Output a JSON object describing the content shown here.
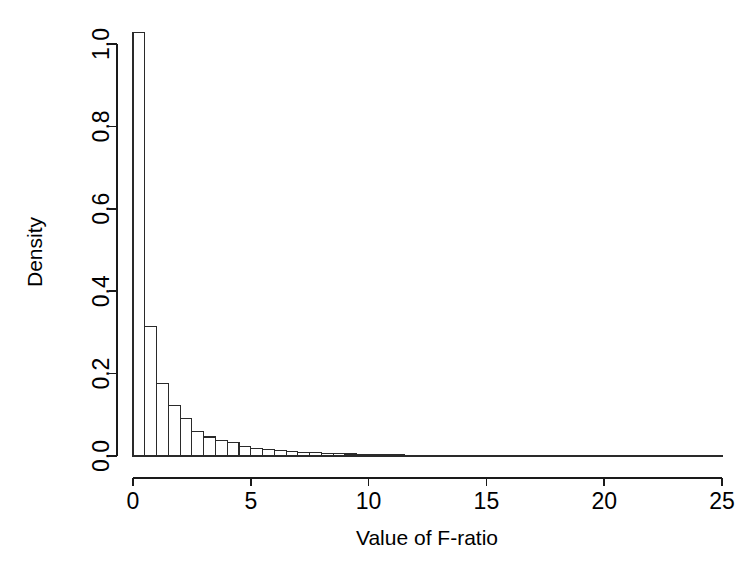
{
  "chart_data": {
    "type": "bar",
    "title": "",
    "subtitle": "",
    "xlabel": "Value of F-ratio",
    "ylabel": "Density",
    "xlim": [
      0,
      25
    ],
    "ylim": [
      0.0,
      1.0
    ],
    "grid": false,
    "legend": null,
    "bin_width": 0.5,
    "x_ticks": [
      0,
      5,
      10,
      15,
      20,
      25
    ],
    "x_tick_labels": [
      "0",
      "5",
      "10",
      "15",
      "20",
      "25"
    ],
    "y_ticks": [
      0.0,
      0.2,
      0.4,
      0.6,
      0.8,
      1.0
    ],
    "y_tick_labels": [
      "0.0",
      "0.2",
      "0.4",
      "0.6",
      "0.8",
      "1.0"
    ],
    "bin_starts": [
      0.0,
      0.5,
      1.0,
      1.5,
      2.0,
      2.5,
      3.0,
      3.5,
      4.0,
      4.5,
      5.0,
      5.5,
      6.0,
      6.5,
      7.0,
      7.5,
      8.0,
      8.5,
      9.0,
      9.5,
      10.0,
      10.5,
      11.0,
      11.5,
      12.0,
      12.5,
      13.0,
      13.5,
      14.0,
      14.5,
      15.0,
      15.5,
      16.0,
      16.5,
      17.0,
      17.5,
      18.0,
      18.5,
      19.0,
      19.5,
      20.0,
      20.5,
      21.0,
      21.5,
      22.0,
      22.5,
      23.0,
      23.5,
      24.0,
      24.5
    ],
    "categories": [
      "0.0-0.5",
      "0.5-1.0",
      "1.0-1.5",
      "1.5-2.0",
      "2.0-2.5",
      "2.5-3.0",
      "3.0-3.5",
      "3.5-4.0",
      "4.0-4.5",
      "4.5-5.0",
      "5.0-5.5",
      "5.5-6.0",
      "6.0-6.5",
      "6.5-7.0",
      "7.0-7.5",
      "7.5-8.0",
      "8.0-8.5",
      "8.5-9.0",
      "9.0-9.5",
      "9.5-10.0",
      "10.0-10.5",
      "10.5-11.0",
      "11.0-11.5",
      "11.5-12.0",
      "12.0-12.5",
      "12.5-13.0",
      "13.0-13.5",
      "13.5-14.0",
      "14.0-14.5",
      "14.5-15.0",
      "15.0-15.5",
      "15.5-16.0",
      "16.0-16.5",
      "16.5-17.0",
      "17.0-17.5",
      "17.5-18.0",
      "18.0-18.5",
      "18.5-19.0",
      "19.0-19.5",
      "19.5-20.0",
      "20.0-20.5",
      "20.5-21.0",
      "21.0-21.5",
      "21.5-22.0",
      "22.0-22.5",
      "22.5-23.0",
      "23.0-23.5",
      "23.5-24.0",
      "24.0-24.5",
      "24.5-25.0"
    ],
    "values": [
      1.028,
      0.315,
      0.176,
      0.122,
      0.09,
      0.06,
      0.046,
      0.037,
      0.032,
      0.024,
      0.019,
      0.016,
      0.013,
      0.01,
      0.009,
      0.008,
      0.007,
      0.006,
      0.005,
      0.004,
      0.004,
      0.003,
      0.003,
      0.002,
      0.002,
      0.002,
      0.002,
      0.001,
      0.001,
      0.001,
      0.001,
      0.001,
      0.001,
      0.001,
      0.001,
      0.0008,
      0.0007,
      0.0006,
      0.0005,
      0.0005,
      0.0004,
      0.0004,
      0.0003,
      0.0003,
      0.0003,
      0.0002,
      0.0002,
      0.0002,
      0.0002,
      0.0001
    ]
  },
  "axes": {
    "x_title": "Value of F-ratio",
    "y_title": "Density"
  }
}
